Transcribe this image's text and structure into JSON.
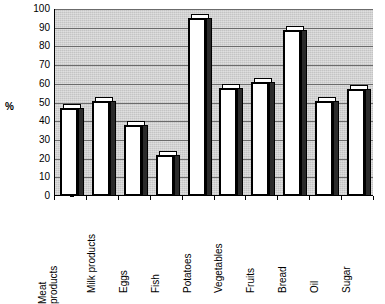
{
  "chart_data": {
    "type": "bar",
    "title": "",
    "xlabel": "",
    "ylabel": "%",
    "ylim": [
      0,
      100
    ],
    "ytick_step": 10,
    "grid": true,
    "legend": "none",
    "categories": [
      "Meat products",
      "Milk products",
      "Eggs",
      "Fish",
      "Potatoes",
      "Vegetables",
      "Fruits",
      "Bread",
      "Oil",
      "Sugar"
    ],
    "category_lines": [
      [
        "Meat",
        "products"
      ],
      [
        "Milk products"
      ],
      [
        "Eggs"
      ],
      [
        "Fish"
      ],
      [
        "Potatoes"
      ],
      [
        "Vegetables"
      ],
      [
        "Fruits"
      ],
      [
        "Bread"
      ],
      [
        "Oil"
      ],
      [
        "Sugar"
      ]
    ],
    "values": [
      47,
      51,
      38,
      22,
      95,
      58,
      61,
      89,
      51,
      57
    ],
    "ytick_labels": [
      "100",
      "90",
      "80",
      "70",
      "60",
      "50",
      "40",
      "30",
      "20",
      "10",
      "0"
    ],
    "colors": {
      "bar_face": "#ffffff",
      "bar_outline": "#000000",
      "bar_side": "#2b2b2b",
      "plot_background": "#c4c4c4",
      "gridline": "#6b6b6b",
      "text": "#000000"
    }
  },
  "axis": {
    "y_title": "%"
  }
}
